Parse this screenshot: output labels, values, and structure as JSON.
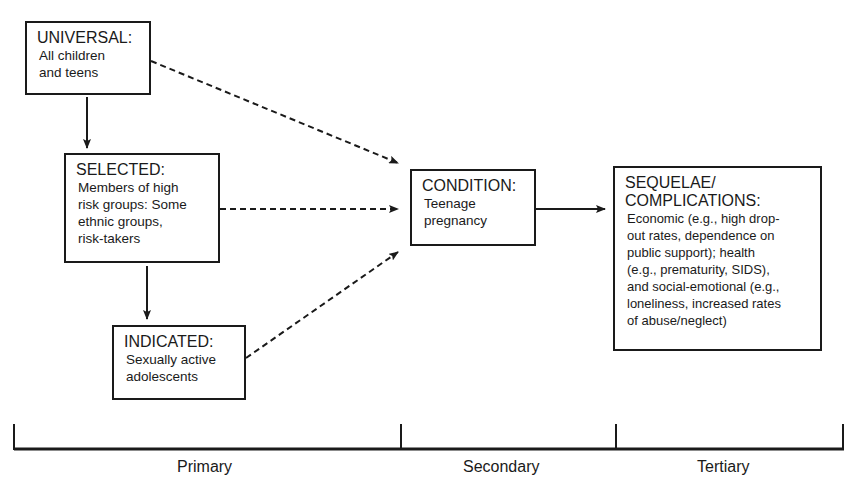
{
  "diagram": {
    "nodes": {
      "universal": {
        "title": "UNIVERSAL:",
        "body": "All children\nand teens"
      },
      "selected": {
        "title": "SELECTED:",
        "body": "Members of high\nrisk groups: Some\nethnic  groups,\nrisk-takers"
      },
      "indicated": {
        "title": "INDICATED:",
        "body": "Sexually active\nadolescents"
      },
      "condition": {
        "title": "CONDITION:",
        "body": "Teenage\npregnancy"
      },
      "sequelae": {
        "title": "SEQUELAE/\nCOMPLICATIONS:",
        "body": "Economic (e.g., high drop-\nout rates, dependence on\npublic  support); health\n(e.g., prematurity, SIDS),\nand social-emotional (e.g.,\nloneliness, increased rates\nof abuse/neglect)"
      }
    },
    "edges": [
      {
        "from": "universal",
        "to": "selected",
        "style": "solid"
      },
      {
        "from": "selected",
        "to": "indicated",
        "style": "solid"
      },
      {
        "from": "universal",
        "to": "condition",
        "style": "dashed"
      },
      {
        "from": "selected",
        "to": "condition",
        "style": "dashed"
      },
      {
        "from": "indicated",
        "to": "condition",
        "style": "dashed"
      },
      {
        "from": "condition",
        "to": "sequelae",
        "style": "solid"
      }
    ],
    "timeline": {
      "segments": [
        {
          "label": "Primary"
        },
        {
          "label": "Secondary"
        },
        {
          "label": "Tertiary"
        }
      ]
    }
  }
}
